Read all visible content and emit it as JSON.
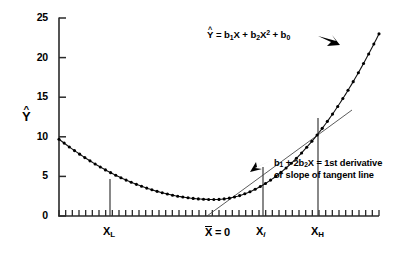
{
  "chart_data": {
    "type": "line",
    "title": "",
    "xlabel": "",
    "ylabel": "Y-hat",
    "ylim": [
      0,
      25
    ],
    "yticks": [
      0,
      5,
      10,
      15,
      20,
      25
    ],
    "ytick_labels": [
      "0",
      "5",
      "10",
      "15",
      "20",
      "25"
    ],
    "xtick_labels": [
      "X_L",
      "X-bar = 0",
      "X_i",
      "X_H"
    ],
    "grid": false,
    "legend": "none",
    "series": [
      {
        "name": "Y-hat = b1X + b2X^2 + b0",
        "marker": "filled-circle",
        "x": [
          0.0,
          1.0,
          2.0,
          3.0,
          4.0,
          5.0,
          6.0,
          7.0,
          8.0,
          9.0,
          10.0,
          11.0,
          12.0,
          13.0,
          14.0,
          15.0,
          16.0,
          17.0,
          18.0,
          19.0,
          20.0,
          21.0,
          22.0,
          23.0,
          24.0,
          25.0,
          26.0,
          27.0,
          28.0,
          29.0,
          30.0,
          31.0,
          32.0,
          33.0,
          34.0,
          35.0,
          36.0,
          37.0,
          38.0,
          39.0,
          40.0,
          41.0,
          42.0,
          43.0,
          44.0,
          45.0,
          46.0,
          47.0,
          48.0,
          49.0,
          50.0
        ],
        "y": [
          9.7,
          9.12,
          8.56,
          8.03,
          7.52,
          7.03,
          6.57,
          6.13,
          5.71,
          5.31,
          4.94,
          4.59,
          4.27,
          3.96,
          3.68,
          3.42,
          3.19,
          2.97,
          2.78,
          2.62,
          2.47,
          2.35,
          2.25,
          2.17,
          2.12,
          2.09,
          2.08,
          2.1,
          2.14,
          2.2,
          2.28,
          2.39,
          2.52,
          2.67,
          2.85,
          3.05,
          3.27,
          3.51,
          3.78,
          4.07,
          4.38,
          4.72,
          5.08,
          5.46,
          5.86,
          6.29,
          6.74,
          7.21,
          7.71,
          8.23,
          8.77
        ]
      }
    ],
    "curve_right_branch": {
      "comment": "steep rising portion reaching about 23 at the right edge",
      "x_at_right_edge": 50,
      "y_at_right_edge": 23.0
    },
    "markers": {
      "X_L": {
        "label": "X_L",
        "y_value": 4.6
      },
      "X_bar": {
        "label": "X-bar = 0",
        "y_value": 2.1
      },
      "X_i": {
        "label": "X_i",
        "y_value": 6.2
      },
      "X_H": {
        "label": "X_H",
        "y_value": 12.4
      }
    },
    "tangent": {
      "touches_at": "X_i",
      "description": "straight line tangent to curve at X_i"
    },
    "annotations": [
      "Y-hat = b1X + b2X^2 + b0",
      "b1 + 2b2X = 1st derivative or slope of tangent line"
    ]
  },
  "axes": {
    "y_title": "Y",
    "y_title_hat": "^",
    "y_tick_labels": [
      "25",
      "20",
      "15",
      "10",
      "5",
      "0"
    ],
    "x_labels": {
      "xl_base": "X",
      "xl_sub": "L",
      "xbar_base": "X",
      "xbar_eq": " = 0",
      "xi_base": "X",
      "xi_sub": "i",
      "xh_base": "X",
      "xh_sub": "H"
    }
  },
  "annotations": {
    "equation": {
      "yhat": "Y",
      "hat": "^",
      "rest_1": " = b",
      "sub_1": "1",
      "rest_2": "X + b",
      "sub_2": "2",
      "rest_3": "X",
      "sup_2": "2",
      "rest_4": " + b",
      "sub_0": "0"
    },
    "derivative": {
      "line1_a": "b",
      "line1_sub1": "1",
      "line1_b": " + 2b",
      "line1_sub2": "2",
      "line1_c": "X = 1st derivative",
      "line2": "or slope of tangent line"
    }
  },
  "colors": {
    "ink": "#000000",
    "axis": "#2a2a2a",
    "tangent": "#4a4a4a",
    "background": "#ffffff"
  }
}
